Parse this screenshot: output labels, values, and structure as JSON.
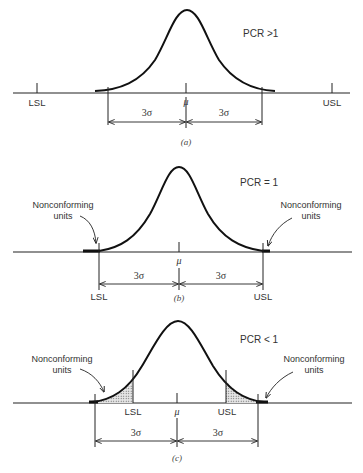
{
  "figure": {
    "panels": [
      {
        "id": "a",
        "caption": "(a)",
        "condition": "PCR >1",
        "mean_label": "μ",
        "lsl_label": "LSL",
        "usl_label": "USL",
        "left_interval_label": "3σ",
        "right_interval_label": "3σ",
        "nonconforming_left": "",
        "nonconforming_right": ""
      },
      {
        "id": "b",
        "caption": "(b)",
        "condition": "PCR = 1",
        "mean_label": "μ",
        "lsl_label": "LSL",
        "usl_label": "USL",
        "left_interval_label": "3σ",
        "right_interval_label": "3σ",
        "nonconforming_left_line1": "Nonconforming",
        "nonconforming_left_line2": "units",
        "nonconforming_right_line1": "Nonconforming",
        "nonconforming_right_line2": "units"
      },
      {
        "id": "c",
        "caption": "(c)",
        "condition": "PCR < 1",
        "mean_label": "μ",
        "lsl_label": "LSL",
        "usl_label": "USL",
        "left_interval_label": "3σ",
        "right_interval_label": "3σ",
        "nonconforming_left_line1": "Nonconforming",
        "nonconforming_left_line2": "units",
        "nonconforming_right_line1": "Nonconforming",
        "nonconforming_right_line2": "units"
      }
    ]
  }
}
